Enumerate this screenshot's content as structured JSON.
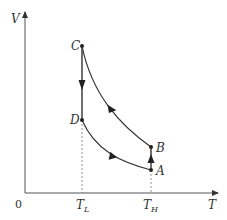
{
  "diagram": {
    "axes": {
      "x_label": "T",
      "y_label": "V",
      "origin_label": "0",
      "x_ticks": [
        {
          "main": "T",
          "sub": "L"
        },
        {
          "main": "T",
          "sub": "H"
        }
      ]
    },
    "points": [
      {
        "id": "A",
        "label": "A",
        "x": 151,
        "y": 170
      },
      {
        "id": "B",
        "label": "B",
        "x": 151,
        "y": 147
      },
      {
        "id": "C",
        "label": "C",
        "x": 82,
        "y": 46
      },
      {
        "id": "D",
        "label": "D",
        "x": 82,
        "y": 120
      }
    ],
    "processes": [
      {
        "from": "A",
        "to": "B",
        "type": "isothermal at T_H (straight up)",
        "direction": "up"
      },
      {
        "from": "B",
        "to": "C",
        "type": "curve",
        "direction": "toward C"
      },
      {
        "from": "C",
        "to": "D",
        "type": "isothermal at T_L (straight down)",
        "direction": "down"
      },
      {
        "from": "D",
        "to": "A",
        "type": "curve",
        "direction": "toward A"
      }
    ],
    "colors": {
      "line": "#333333",
      "dashed": "#777777"
    }
  }
}
